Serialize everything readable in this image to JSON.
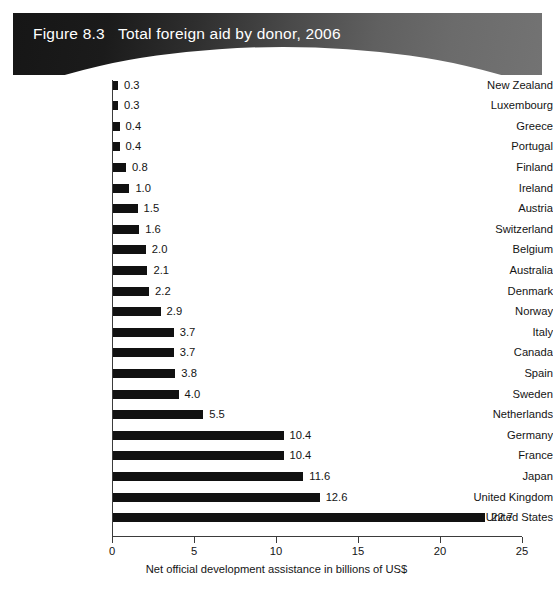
{
  "header": {
    "figure_number": "Figure 8.3",
    "title": "Total foreign aid by donor, 2006",
    "full_title": "Figure 8.3   Total foreign aid by donor, 2006",
    "background_color_left": "#161616",
    "background_color_right": "#737373",
    "text_color": "#ffffff"
  },
  "chart_data": {
    "type": "bar",
    "orientation": "horizontal",
    "title": "Total foreign aid by donor, 2006",
    "xlabel": "Net official development assistance in billions of US$",
    "ylabel": "",
    "xlim": [
      0,
      25
    ],
    "xticks": [
      0,
      5,
      10,
      15,
      20,
      25
    ],
    "xtick_labels": [
      "0",
      "5",
      "10",
      "15",
      "20",
      "25"
    ],
    "grid": false,
    "legend": false,
    "bar_color": "#111111",
    "categories": [
      "New Zealand",
      "Luxembourg",
      "Greece",
      "Portugal",
      "Finland",
      "Ireland",
      "Austria",
      "Switzerland",
      "Belgium",
      "Australia",
      "Denmark",
      "Norway",
      "Italy",
      "Canada",
      "Spain",
      "Sweden",
      "Netherlands",
      "Germany",
      "France",
      "Japan",
      "United Kingdom",
      "United States"
    ],
    "values": [
      0.3,
      0.3,
      0.4,
      0.4,
      0.8,
      1.0,
      1.5,
      1.6,
      2.0,
      2.1,
      2.2,
      2.9,
      3.7,
      3.7,
      3.8,
      4.0,
      5.5,
      10.4,
      10.4,
      11.6,
      12.6,
      22.7
    ],
    "value_labels": [
      "0.3",
      "0.3",
      "0.4",
      "0.4",
      "0.8",
      "1.0",
      "1.5",
      "1.6",
      "2.0",
      "2.1",
      "2.2",
      "2.9",
      "3.7",
      "3.7",
      "3.8",
      "4.0",
      "5.5",
      "10.4",
      "10.4",
      "11.6",
      "12.6",
      "22.7"
    ]
  }
}
